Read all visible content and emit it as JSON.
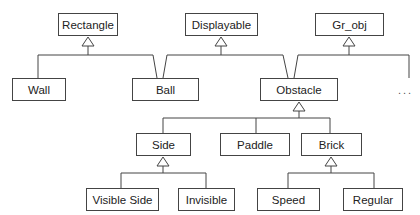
{
  "diagram": {
    "type": "uml-class-hierarchy",
    "classes": [
      {
        "id": "rectangle",
        "label": "Rectangle"
      },
      {
        "id": "displayable",
        "label": "Displayable"
      },
      {
        "id": "grobj",
        "label": "Gr_obj"
      },
      {
        "id": "wall",
        "label": "Wall"
      },
      {
        "id": "ball",
        "label": "Ball"
      },
      {
        "id": "obstacle",
        "label": "Obstacle"
      },
      {
        "id": "side",
        "label": "Side"
      },
      {
        "id": "paddle",
        "label": "Paddle"
      },
      {
        "id": "brick",
        "label": "Brick"
      },
      {
        "id": "visible-side",
        "label": "Visible Side"
      },
      {
        "id": "invisible",
        "label": "Invisible"
      },
      {
        "id": "speed",
        "label": "Speed"
      },
      {
        "id": "regular",
        "label": "Regular"
      }
    ],
    "ellipsis": "...",
    "inheritance": [
      {
        "child": "Wall",
        "parent": "Rectangle"
      },
      {
        "child": "Ball",
        "parent": "Rectangle"
      },
      {
        "child": "Ball",
        "parent": "Displayable"
      },
      {
        "child": "Obstacle",
        "parent": "Displayable"
      },
      {
        "child": "Obstacle",
        "parent": "Gr_obj"
      },
      {
        "child": "...",
        "parent": "Gr_obj"
      },
      {
        "child": "Side",
        "parent": "Obstacle"
      },
      {
        "child": "Paddle",
        "parent": "Obstacle"
      },
      {
        "child": "Brick",
        "parent": "Obstacle"
      },
      {
        "child": "Visible Side",
        "parent": "Side"
      },
      {
        "child": "Invisible",
        "parent": "Side"
      },
      {
        "child": "Speed",
        "parent": "Brick"
      },
      {
        "child": "Regular",
        "parent": "Brick"
      }
    ]
  }
}
